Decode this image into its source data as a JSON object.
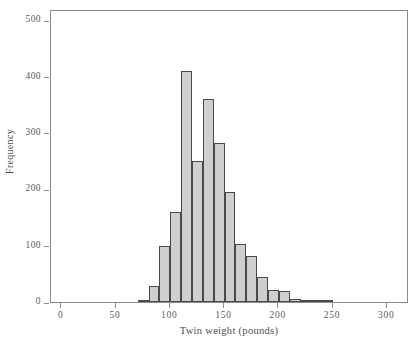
{
  "chart_data": {
    "type": "bar",
    "title": "",
    "xlabel": "Twin weight (pounds)",
    "ylabel": "Frequency",
    "xlim": [
      -10,
      320
    ],
    "ylim": [
      0,
      520
    ],
    "grid": false,
    "legend": null,
    "bin_width": 10,
    "xticks": [
      0,
      50,
      100,
      150,
      200,
      250,
      300
    ],
    "xtick_labels": [
      "0",
      "50",
      "100",
      "150",
      "200",
      "250",
      "300"
    ],
    "yticks": [
      0,
      100,
      200,
      300,
      400,
      500
    ],
    "ytick_labels": [
      "0",
      "100",
      "200",
      "300",
      "400",
      "500"
    ],
    "bin_starts": [
      70,
      80,
      90,
      100,
      110,
      120,
      130,
      140,
      150,
      160,
      170,
      180,
      190,
      200,
      210,
      220,
      230,
      240
    ],
    "categories": [
      "70-80",
      "80-90",
      "90-100",
      "100-110",
      "110-120",
      "120-130",
      "130-140",
      "140-150",
      "150-160",
      "160-170",
      "170-180",
      "180-190",
      "190-200",
      "200-210",
      "210-220",
      "220-230",
      "230-240",
      "240-250"
    ],
    "values": [
      3,
      28,
      100,
      160,
      410,
      250,
      360,
      283,
      196,
      103,
      82,
      45,
      21,
      19,
      6,
      4,
      3,
      3
    ],
    "bar_fill_color": "#cfcfcf",
    "bar_edge_color": "#4a4a4a",
    "axis_color": "#8c8c8c",
    "background_color": "#ffffff"
  }
}
